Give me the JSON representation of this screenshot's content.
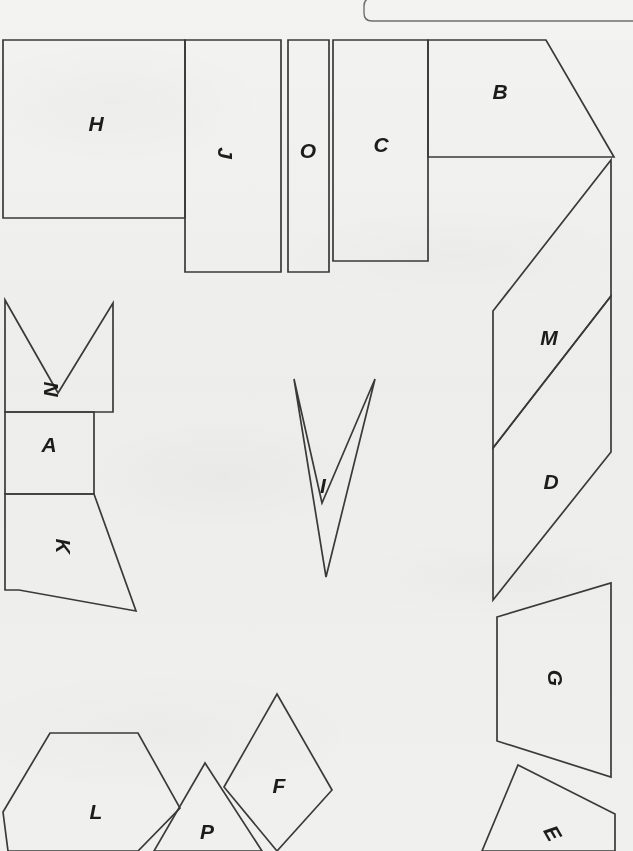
{
  "document": {
    "title": "Geometric Shapes Worksheet",
    "background_color": "#f7f7f6",
    "stroke_color": "#3a3a3a",
    "label_color": "#1c1c1c",
    "width": 633,
    "height": 851
  },
  "top_panel": {
    "name": "cropped-rounded-box",
    "description": "rounded-corner rectangle cropped at top-right edge"
  },
  "shapes": [
    {
      "id": "H",
      "label": "H",
      "kind": "rectangle",
      "points": "3,40 185,40 185,218 3,218",
      "label_x": 96,
      "label_y": 125,
      "label_rotation": 0
    },
    {
      "id": "J",
      "label": "J",
      "kind": "rectangle",
      "points": "185,40 281,40 281,272 185,272",
      "label_x": 224,
      "label_y": 153,
      "label_rotation": 90
    },
    {
      "id": "O",
      "label": "O",
      "kind": "rectangle",
      "points": "288,40 329,40 329,272 288,272",
      "label_x": 308,
      "label_y": 152,
      "label_rotation": 0
    },
    {
      "id": "C",
      "label": "C",
      "kind": "rectangle",
      "points": "333,40 428,40 428,261 333,261",
      "label_x": 381,
      "label_y": 146,
      "label_rotation": 0
    },
    {
      "id": "B",
      "label": "B",
      "kind": "trapezoid",
      "points": "428,40 546,40 614,157 428,157",
      "label_x": 500,
      "label_y": 93,
      "label_rotation": 0
    },
    {
      "id": "M",
      "label": "M",
      "kind": "parallelogram",
      "points": "493,311 611,160 611,296 493,448",
      "label_x": 549,
      "label_y": 339,
      "label_rotation": 0
    },
    {
      "id": "D",
      "label": "D",
      "kind": "parallelogram",
      "points": "493,448 611,296 611,452 493,600",
      "label_x": 551,
      "label_y": 483,
      "label_rotation": 0
    },
    {
      "id": "N",
      "label": "N",
      "kind": "chevron-notched-rectangle",
      "points": "5,300 58,393 113,303 113,412 5,412",
      "label_x": 50,
      "label_y": 389,
      "label_rotation": 90
    },
    {
      "id": "A",
      "label": "A",
      "kind": "rectangle",
      "points": "5,412 94,412 94,494 5,494",
      "label_x": 49,
      "label_y": 446,
      "label_rotation": 0
    },
    {
      "id": "K",
      "label": "K",
      "kind": "quadrilateral",
      "points": "5,494 94,494 136,611 19,590 5,590",
      "label_x": 62,
      "label_y": 546,
      "label_rotation": 90
    },
    {
      "id": "I",
      "label": "I",
      "kind": "arrow-dart",
      "points": "294,379 322,503 375,379 326,577",
      "label_x": 323,
      "label_y": 487,
      "label_rotation": 0
    },
    {
      "id": "G",
      "label": "G",
      "kind": "trapezoid",
      "points": "497,617 611,583 611,777 497,741",
      "label_x": 554,
      "label_y": 678,
      "label_rotation": 90
    },
    {
      "id": "E",
      "label": "E",
      "kind": "quadrilateral",
      "points": "518,765 615,814 615,851 482,851",
      "label_x": 551,
      "label_y": 834,
      "label_rotation": 60
    },
    {
      "id": "L",
      "label": "L",
      "kind": "hexagon",
      "points": "50,733 138,733 180,808 138,851 8,851 3,812",
      "label_x": 96,
      "label_y": 813,
      "label_rotation": 0
    },
    {
      "id": "P",
      "label": "P",
      "kind": "diamond",
      "points": "205,763 262,851 154,851",
      "label_x": 207,
      "label_y": 833,
      "label_rotation": 0
    },
    {
      "id": "F",
      "label": "F",
      "kind": "diamond",
      "points": "277,694 332,790 277,851 224,787",
      "label_x": 279,
      "label_y": 787,
      "label_rotation": 0
    }
  ]
}
